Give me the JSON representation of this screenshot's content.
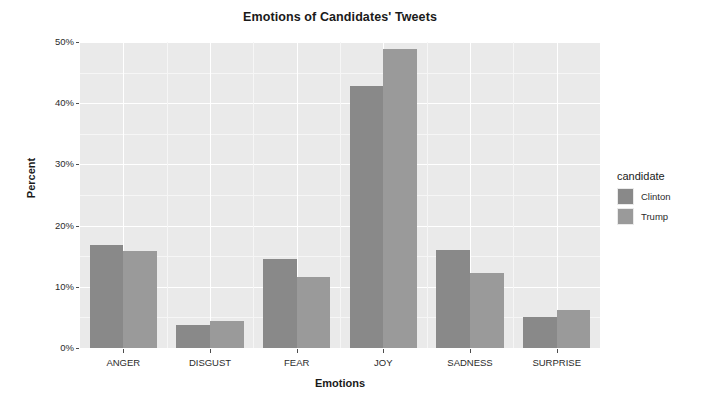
{
  "chart_data": {
    "type": "bar",
    "title": "Emotions of Candidates' Tweets",
    "xlabel": "Emotions",
    "ylabel": "Percent",
    "categories": [
      "ANGER",
      "DISGUST",
      "FEAR",
      "JOY",
      "SADNESS",
      "SURPRISE"
    ],
    "series": [
      {
        "name": "Clinton",
        "color": "#898989",
        "values": [
          16.8,
          3.8,
          14.6,
          42.8,
          16.0,
          5.0
        ]
      },
      {
        "name": "Trump",
        "color": "#9a9a9a",
        "values": [
          15.9,
          4.4,
          11.6,
          48.9,
          12.3,
          6.2
        ]
      }
    ],
    "ylim": [
      0,
      50
    ],
    "yticks": [
      {
        "value": 0,
        "label": "0%"
      },
      {
        "value": 10,
        "label": "10%"
      },
      {
        "value": 20,
        "label": "20%"
      },
      {
        "value": 30,
        "label": "30%"
      },
      {
        "value": 40,
        "label": "40%"
      },
      {
        "value": 50,
        "label": "50%"
      }
    ],
    "yminor": [
      5,
      15,
      25,
      35,
      45
    ],
    "grid": true,
    "legend": {
      "title": "candidate",
      "position": "right",
      "entries": [
        "Clinton",
        "Trump"
      ]
    },
    "panel_background": "#eaeaea",
    "gridline_color": "#ffffff"
  },
  "legend": {
    "title": "candidate",
    "entries": [
      {
        "label": "Clinton",
        "swatch_name": "legend-swatch-clinton"
      },
      {
        "label": "Trump",
        "swatch_name": "legend-swatch-trump"
      }
    ]
  },
  "axes": {
    "y_title": "Percent",
    "x_title": "Emotions"
  }
}
